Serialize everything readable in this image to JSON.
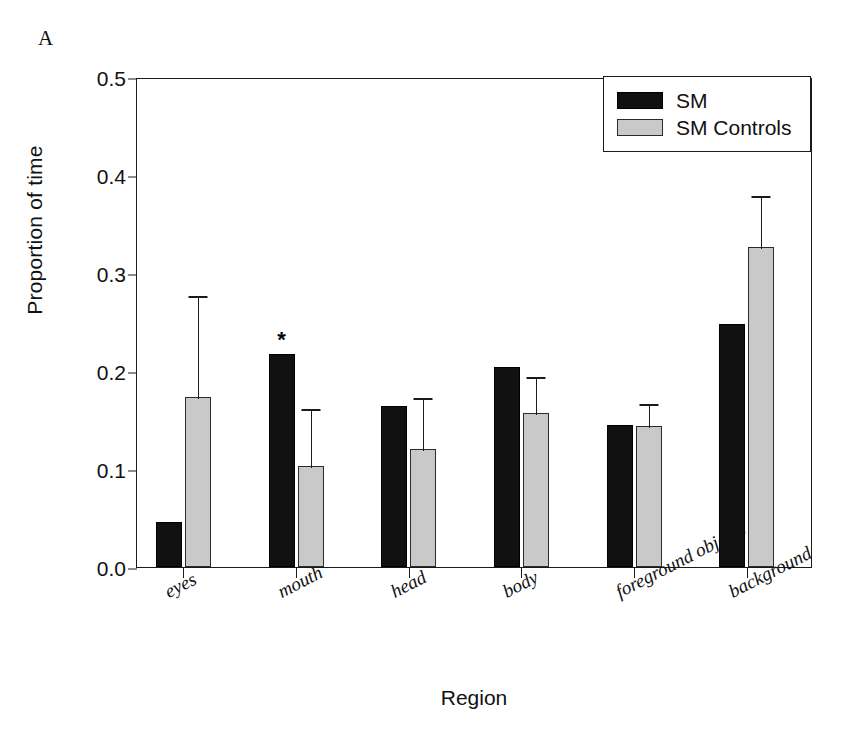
{
  "panel": {
    "letter": "A"
  },
  "chart_data": {
    "type": "bar",
    "title": "",
    "xlabel": "Region",
    "ylabel": "Proportion of time",
    "categories": [
      "eyes",
      "mouth",
      "head",
      "body",
      "foreground objects",
      "background"
    ],
    "ylim": [
      0.0,
      0.5
    ],
    "ytick_labels": [
      "0.0",
      "0.1",
      "0.2",
      "0.3",
      "0.4",
      "0.5"
    ],
    "ytick_values": [
      0.0,
      0.1,
      0.2,
      0.3,
      0.4,
      0.5
    ],
    "grid": false,
    "legend_position": "top-right",
    "series": [
      {
        "name": "SM",
        "color": "#111111",
        "values": [
          0.046,
          0.217,
          0.164,
          0.204,
          0.145,
          0.248
        ],
        "errors": [
          null,
          null,
          null,
          null,
          null,
          null
        ]
      },
      {
        "name": "SM Controls",
        "color": "#c9c9c9",
        "values": [
          0.173,
          0.103,
          0.12,
          0.157,
          0.144,
          0.327
        ],
        "errors": [
          0.106,
          0.06,
          0.054,
          0.039,
          0.024,
          0.054
        ]
      }
    ],
    "annotations": [
      {
        "label": "*",
        "category": "mouth",
        "series": "SM",
        "value": 0.217
      }
    ]
  },
  "legend": {
    "entries": [
      {
        "label": "SM",
        "swatch": "sm"
      },
      {
        "label": "SM Controls",
        "swatch": "ctrl"
      }
    ]
  }
}
